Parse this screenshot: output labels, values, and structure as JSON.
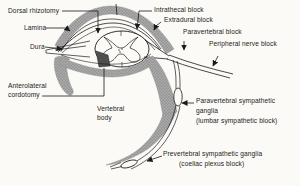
{
  "figure": {
    "colors": {
      "background": "#fbfaf6",
      "ink": "#1b1b1b",
      "band_base": "#a9a9a9",
      "band_dot": "#6f6f6f",
      "band_edge": "#8a8a8a",
      "wedge": "#4f4f4f",
      "cord_fill": "#fcfbf7"
    },
    "labels": {
      "dorsal_rhizotomy": "Dorsal rhizotomy",
      "lamina": "Lamina",
      "dura": "Dura",
      "anterolateral_line1": "Anterolateral",
      "anterolateral_line2": "cordotomy",
      "intrathecal_block": "Intrathecal block",
      "extradural_block": "Extradural block",
      "paravertebral_block": "Paravertebral block",
      "peripheral_nerve_block": "Peripheral nerve block",
      "vertebral_body_line1": "Vertebral",
      "vertebral_body_line2": "body",
      "paravertebral_symp_line1": "Paravertebral sympathetic",
      "paravertebral_symp_line2": "ganglia",
      "paravertebral_symp_line3": "(lumbar sympathetic block)",
      "prevertebral_symp_line1": "Prevertebral sympathetic ganglia",
      "prevertebral_symp_line2": "(coeliac plexus block)"
    }
  }
}
